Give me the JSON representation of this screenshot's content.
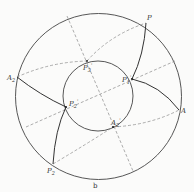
{
  "figure": {
    "caption": "b",
    "colors": {
      "line": "#444444",
      "dashed": "#8a8a8a",
      "background": "#fbfbfa"
    },
    "circles": {
      "outer": {
        "cx": 98.5,
        "cy": 96.5,
        "r": 83
      },
      "inner": {
        "cx": 98,
        "cy": 96,
        "r": 35
      }
    },
    "points": {
      "P": {
        "base": "P",
        "sub": "",
        "prime": "",
        "x": 146,
        "y": 23
      },
      "A": {
        "base": "A",
        "sub": "",
        "prime": "",
        "x": 179,
        "y": 110
      },
      "A2": {
        "base": "A",
        "sub": "2",
        "prime": "",
        "x": 17,
        "y": 77
      },
      "P2": {
        "base": "P",
        "sub": "2",
        "prime": "",
        "x": 53,
        "y": 164
      },
      "P1p": {
        "base": "P",
        "sub": "1",
        "prime": "'",
        "x": 132,
        "y": 79
      },
      "P3p": {
        "base": "P",
        "sub": "3",
        "prime": "'",
        "x": 87,
        "y": 61
      },
      "P2p": {
        "base": "P",
        "sub": "2",
        "prime": "'",
        "x": 66,
        "y": 107
      },
      "A2p": {
        "base": "A",
        "sub": "2",
        "prime": "'",
        "x": 113,
        "y": 127
      }
    },
    "labels": {
      "P": "P",
      "A": "A",
      "A2_base": "A",
      "A2_sub": "2",
      "P2_base": "P",
      "P2_sub": "2",
      "P1p_base": "P",
      "P1p_sub": "1",
      "P1p_prime": "'",
      "P3p_base": "P",
      "P3p_sub": "3",
      "P3p_prime": "'",
      "P2p_base": "P",
      "P2p_sub": "2",
      "P2p_prime": "'",
      "A2p_base": "A",
      "A2p_sub": "2",
      "A2p_prime": "'"
    }
  }
}
